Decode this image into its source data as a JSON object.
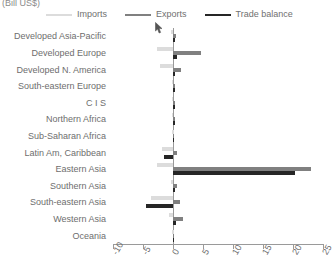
{
  "title": "(Bill US$)",
  "legend": [
    {
      "label": "Imports",
      "color": "#dcdcdc",
      "key": "imports"
    },
    {
      "label": "Exports",
      "color": "#808080",
      "key": "exports"
    },
    {
      "label": "Trade balance",
      "color": "#262626",
      "key": "balance"
    }
  ],
  "axis": {
    "ticks": [
      "-10",
      "-5",
      "0",
      "5",
      "10",
      "15",
      "20",
      "25"
    ],
    "min": -10,
    "max": 25
  },
  "chart_data": {
    "type": "bar",
    "orientation": "horizontal",
    "title": "(Bill US$)",
    "xlabel": "(Bill US$)",
    "ylabel": "",
    "xlim": [
      -10,
      25
    ],
    "grid": false,
    "legend_position": "top",
    "categories": [
      "Developed Asia-Pacific",
      "Developed Europe",
      "Developed N. America",
      "South-eastern Europe",
      "C I S",
      "Northern Africa",
      "Sub-Saharan Africa",
      "Latin Am, Caribbean",
      "Eastern Asia",
      "Southern Asia",
      "South-eastern Asia",
      "Western Asia",
      "Oceania"
    ],
    "series": [
      {
        "name": "Imports",
        "color": "#dcdcdc",
        "values": [
          -0.3,
          -2.6,
          -2.1,
          -0.2,
          -0.2,
          -0.2,
          -0.1,
          -1.8,
          -2.6,
          -0.4,
          -3.6,
          -0.6,
          -0.1
        ]
      },
      {
        "name": "Exports",
        "color": "#808080",
        "values": [
          0.5,
          4.6,
          1.4,
          0.3,
          0.4,
          0.3,
          0.2,
          0.6,
          23.0,
          0.6,
          1.1,
          1.7,
          0.1
        ]
      },
      {
        "name": "Trade balance",
        "color": "#262626",
        "values": [
          0.4,
          0.7,
          0.3,
          0.3,
          0.4,
          0.3,
          0.2,
          -1.5,
          20.4,
          0.4,
          -4.5,
          0.5,
          0.1
        ]
      }
    ]
  }
}
